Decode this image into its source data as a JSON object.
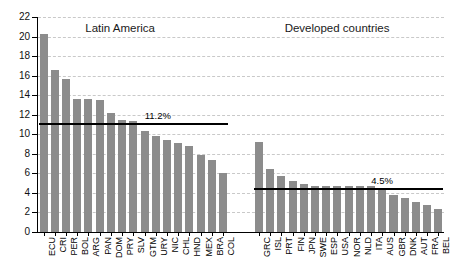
{
  "chart_data": {
    "type": "bar",
    "title": "",
    "xlabel": "",
    "ylabel": "",
    "ylim": [
      0,
      22
    ],
    "ytick_step": 2,
    "yticks": [
      0,
      2,
      4,
      6,
      8,
      10,
      12,
      14,
      16,
      18,
      20,
      22
    ],
    "ytick_labels": [
      "0",
      "2",
      "4",
      "6",
      "8",
      "10",
      "12",
      "14",
      "16",
      "18",
      "20",
      "22"
    ],
    "grid": true,
    "legend": "none",
    "bar_color": "#8c8c8c",
    "panels": [
      {
        "name": "latin-america",
        "title": "Latin America",
        "categories": [
          "ECU",
          "CRI",
          "PER",
          "BOL",
          "ARG",
          "PAN",
          "DOM",
          "PRY",
          "SLV",
          "GTM",
          "URY",
          "NIC",
          "CHL",
          "HND",
          "MEX",
          "BRA",
          "COL"
        ],
        "values": [
          20.3,
          16.6,
          15.7,
          13.6,
          13.6,
          13.5,
          12.2,
          11.5,
          11.4,
          10.3,
          9.8,
          9.4,
          9.1,
          8.8,
          7.9,
          7.4,
          6.0
        ],
        "average": 11.2,
        "average_label": "11.2%"
      },
      {
        "name": "developed-countries",
        "title": "Developed countries",
        "categories": [
          "GRC",
          "ISL",
          "PRT",
          "FIN",
          "JPN",
          "SWE",
          "ESP",
          "USA",
          "NOR",
          "NLD",
          "ITA",
          "AUS",
          "GBR",
          "DNK",
          "AUT",
          "FRA",
          "BEL"
        ],
        "values": [
          9.2,
          6.4,
          5.7,
          5.2,
          4.9,
          4.7,
          4.7,
          4.7,
          4.7,
          4.7,
          4.7,
          4.4,
          3.8,
          3.5,
          3.1,
          2.8,
          2.4
        ],
        "average": 4.5,
        "average_label": "4.5%"
      }
    ]
  }
}
